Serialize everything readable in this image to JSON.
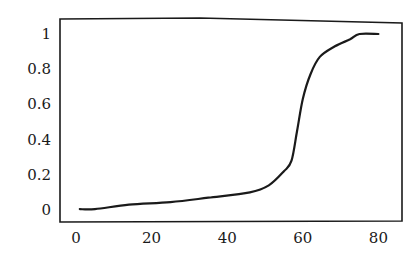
{
  "chart_data": {
    "type": "line",
    "title": "",
    "xlabel": "",
    "ylabel": "",
    "xlim": [
      -4,
      86
    ],
    "ylim": [
      -0.07,
      1.08
    ],
    "grid": false,
    "legend": null,
    "x_ticks": [
      0,
      20,
      40,
      60,
      80
    ],
    "x_tick_labels": [
      "0",
      "20",
      "40",
      "60",
      "80"
    ],
    "y_ticks": [
      0,
      0.2,
      0.4,
      0.6,
      0.8,
      1
    ],
    "y_tick_labels": [
      "0",
      "0.2",
      "0.4",
      "0.6",
      "0.8",
      "1"
    ],
    "series": [
      {
        "name": "curve",
        "color": "#1a1a1a",
        "x": [
          1,
          5,
          14,
          25,
          35,
          46,
          51,
          55,
          57,
          58.5,
          60,
          62,
          64.5,
          68.5,
          72.5,
          75,
          80
        ],
        "y": [
          0.005,
          0.005,
          0.03,
          0.045,
          0.07,
          0.1,
          0.14,
          0.22,
          0.28,
          0.45,
          0.63,
          0.77,
          0.87,
          0.93,
          0.97,
          1.0,
          1.0
        ]
      }
    ]
  },
  "style": {
    "frame_color": "#1a1a1a",
    "line_color": "#1a1a1a",
    "background": "#ffffff"
  }
}
